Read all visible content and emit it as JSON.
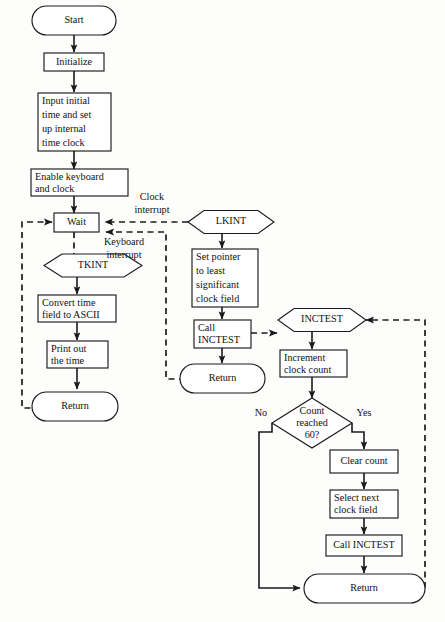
{
  "diagram": {
    "type": "flowchart",
    "colors": {
      "background": "#fdfdfc",
      "stroke": "#1a1a1a",
      "fill": "#ffffff"
    }
  },
  "nodes": {
    "start": {
      "label": "Start",
      "shape": "terminator"
    },
    "initialize": {
      "label": "Initialize",
      "shape": "process"
    },
    "input_initial": {
      "shape": "process",
      "line1": "Input initial",
      "line2": "time and set",
      "line3": "up internal",
      "line4": "time clock"
    },
    "enable_kbd": {
      "shape": "process",
      "line1": "Enable keyboard",
      "line2": "and clock"
    },
    "wait": {
      "label": "Wait",
      "shape": "process"
    },
    "tkint": {
      "label": "TKINT",
      "shape": "hexagon"
    },
    "convert_time": {
      "shape": "process",
      "line1": "Convert time",
      "line2": "field to ASCII"
    },
    "print_time": {
      "shape": "process",
      "line1": "Print out",
      "line2": "the time"
    },
    "tkint_return": {
      "label": "Return",
      "shape": "terminator"
    },
    "lkint": {
      "label": "LKINT",
      "shape": "hexagon"
    },
    "set_pointer": {
      "shape": "process",
      "line1": "Set pointer",
      "line2": "to least",
      "line3": "significant",
      "line4": "clock field"
    },
    "call_inctest_1": {
      "shape": "process",
      "line1": "Call",
      "line2": "INCTEST"
    },
    "lkint_return": {
      "label": "Return",
      "shape": "terminator"
    },
    "inctest": {
      "label": "INCTEST",
      "shape": "hexagon"
    },
    "increment_count": {
      "shape": "process",
      "line1": "Increment",
      "line2": "clock count"
    },
    "count_reached": {
      "shape": "decision",
      "line1": "Count",
      "line2": "reached",
      "line3": "60?"
    },
    "clear_count": {
      "label": "Clear count",
      "shape": "process"
    },
    "select_next": {
      "shape": "process",
      "line1": "Select next",
      "line2": "clock field"
    },
    "call_inctest_2": {
      "label": "Call INCTEST",
      "shape": "process"
    },
    "inctest_return": {
      "label": "Return",
      "shape": "terminator"
    }
  },
  "edge_labels": {
    "clock_interrupt_1": "Clock",
    "clock_interrupt_2": "interrupt",
    "keyboard_interrupt_1": "Keyboard",
    "keyboard_interrupt_2": "interrupt",
    "decision_no": "No",
    "decision_yes": "Yes"
  }
}
